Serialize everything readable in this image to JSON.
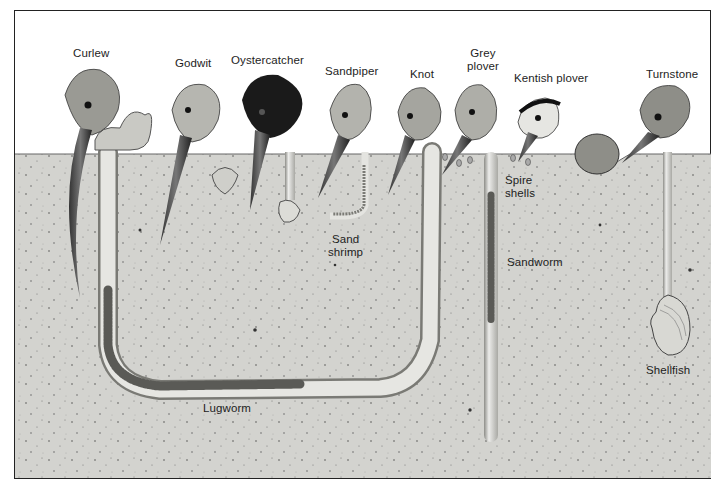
{
  "diagram": {
    "colors": {
      "sky": "#ffffff",
      "sediment": "#d4d4d0",
      "sediment_dark": "#bdbdb8",
      "burrow": "#e4e4e0",
      "ink": "#222222",
      "worm": "#6e6e6a"
    },
    "birds": [
      {
        "name": "Curlew"
      },
      {
        "name": "Godwit"
      },
      {
        "name": "Oystercatcher"
      },
      {
        "name": "Sandpiper"
      },
      {
        "name": "Knot"
      },
      {
        "name": "Grey plover",
        "line1": "Grey",
        "line2": "plover"
      },
      {
        "name": "Kentish plover"
      },
      {
        "name": "Turnstone"
      }
    ],
    "prey": [
      {
        "name": "Sand shrimp",
        "line1": "Sand",
        "line2": "shrimp"
      },
      {
        "name": "Spire shells",
        "line1": "Spire",
        "line2": "shells"
      },
      {
        "name": "Sandworm"
      },
      {
        "name": "Shellfish"
      },
      {
        "name": "Lugworm"
      }
    ]
  }
}
